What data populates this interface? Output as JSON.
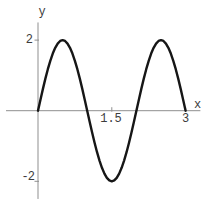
{
  "chart_data": {
    "type": "line",
    "title": "",
    "xlabel": "x",
    "ylabel": "y",
    "xlim": [
      -0.65,
      3.3
    ],
    "ylim": [
      -2.5,
      2.5
    ],
    "grid": false,
    "axis_color": "#8f8f8f",
    "label_color": "#3c3c3c",
    "x_ticks": [
      {
        "value": 1.5,
        "label": "1.5"
      },
      {
        "value": 3,
        "label": "3"
      }
    ],
    "y_ticks": [
      {
        "value": 2,
        "label": "2"
      },
      {
        "value": -2,
        "label": "-2"
      }
    ],
    "series": [
      {
        "name": "curve",
        "color": "#161616",
        "stroke_width": 2.4,
        "x": [
          0,
          0.05,
          0.1,
          0.15,
          0.2,
          0.25,
          0.3,
          0.35,
          0.4,
          0.45,
          0.5,
          0.55,
          0.6,
          0.65,
          0.7,
          0.75,
          0.8,
          0.85,
          0.9,
          0.95,
          1,
          1.05,
          1.1,
          1.15,
          1.2,
          1.25,
          1.3,
          1.35,
          1.4,
          1.45,
          1.5,
          1.55,
          1.6,
          1.65,
          1.7,
          1.75,
          1.8,
          1.85,
          1.9,
          1.95,
          2,
          2.05,
          2.1,
          2.15,
          2.2,
          2.25,
          2.3,
          2.35,
          2.4,
          2.45,
          2.5,
          2.55,
          2.6,
          2.65,
          2.7,
          2.75,
          2.8,
          2.85,
          2.9,
          2.95,
          3
        ],
        "y": [
          0,
          0.313,
          0.618,
          0.908,
          1.176,
          1.414,
          1.618,
          1.782,
          1.902,
          1.975,
          2,
          1.975,
          1.902,
          1.782,
          1.618,
          1.414,
          1.176,
          0.908,
          0.618,
          0.313,
          0,
          -0.313,
          -0.618,
          -0.908,
          -1.176,
          -1.414,
          -1.618,
          -1.782,
          -1.902,
          -1.975,
          -2,
          -1.975,
          -1.902,
          -1.782,
          -1.618,
          -1.414,
          -1.176,
          -0.908,
          -0.618,
          -0.313,
          0,
          0.313,
          0.618,
          0.908,
          1.176,
          1.414,
          1.618,
          1.782,
          1.902,
          1.975,
          2,
          1.975,
          1.902,
          1.782,
          1.618,
          1.414,
          1.176,
          0.908,
          0.618,
          0.313,
          0
        ]
      }
    ]
  }
}
